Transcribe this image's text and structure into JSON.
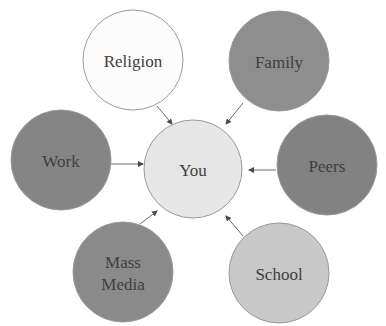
{
  "diagram": {
    "type": "hub-and-spoke",
    "center": {
      "id": "you",
      "label": "You",
      "fill": "#e6e6e6"
    },
    "nodes": [
      {
        "id": "religion",
        "label_lines": [
          "Religion"
        ],
        "fill": "#fcfcfc",
        "arrow_to": "you"
      },
      {
        "id": "family",
        "label_lines": [
          "Family"
        ],
        "fill": "#8e8e8e",
        "arrow_to": "you"
      },
      {
        "id": "work",
        "label_lines": [
          "Work"
        ],
        "fill": "#858585",
        "arrow_to": "you"
      },
      {
        "id": "peers",
        "label_lines": [
          "Peers"
        ],
        "fill": "#828282",
        "arrow_to": "you"
      },
      {
        "id": "mass-media",
        "label_lines": [
          "Mass",
          "Media"
        ],
        "fill": "#8a8a8a",
        "arrow_to": "you"
      },
      {
        "id": "school",
        "label_lines": [
          "School"
        ],
        "fill": "#c8c8c8",
        "arrow_to": "you"
      }
    ]
  }
}
